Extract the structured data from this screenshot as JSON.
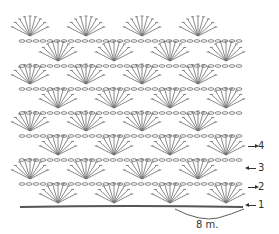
{
  "diagram": {
    "type": "crochet-stitch-chart",
    "stroke_color": "#6b6b6b",
    "foundation_color": "#555555",
    "rows_of_fans": 8,
    "fans_per_row": 4,
    "row_labels": [
      {
        "label": "4",
        "direction": "right"
      },
      {
        "label": "3",
        "direction": "left"
      },
      {
        "label": "2",
        "direction": "right"
      },
      {
        "label": "1",
        "direction": "left"
      }
    ],
    "repeat_label": "8 m."
  }
}
